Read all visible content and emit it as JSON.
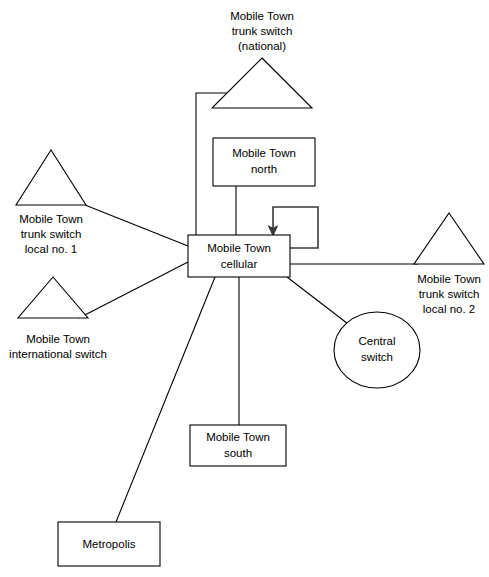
{
  "diagram": {
    "canvas": {
      "width": 489,
      "height": 577
    },
    "colors": {
      "background": "#ffffff",
      "stroke": "#000000",
      "arrow": "#3a3a3a",
      "text": "#000000"
    },
    "nodes": {
      "trunk_national": {
        "shape": "triangle",
        "label_lines": [
          "Mobile Town",
          "trunk switch",
          "(national)"
        ],
        "label_position": "above"
      },
      "mobile_north": {
        "shape": "rectangle",
        "label_lines": [
          "Mobile Town",
          "north"
        ],
        "label_position": "inside"
      },
      "mobile_cellular": {
        "shape": "rectangle",
        "label_lines": [
          "Mobile Town",
          "cellular"
        ],
        "label_position": "inside"
      },
      "trunk_local_1": {
        "shape": "triangle",
        "label_lines": [
          "Mobile Town",
          "trunk switch",
          "local no. 1"
        ],
        "label_position": "below"
      },
      "international": {
        "shape": "triangle",
        "label_lines": [
          "Mobile Town",
          "international switch"
        ],
        "label_position": "below"
      },
      "trunk_local_2": {
        "shape": "triangle",
        "label_lines": [
          "Mobile Town",
          "trunk switch",
          "local no. 2"
        ],
        "label_position": "below"
      },
      "central_switch": {
        "shape": "ellipse",
        "label_lines": [
          "Central",
          "switch"
        ],
        "label_position": "inside"
      },
      "mobile_south": {
        "shape": "rectangle",
        "label_lines": [
          "Mobile Town",
          "south"
        ],
        "label_position": "inside"
      },
      "metropolis": {
        "shape": "rectangle",
        "label_lines": [
          "Metropolis"
        ],
        "label_position": "inside"
      }
    },
    "links": [
      {
        "id": "cellular-trunk-national",
        "from": "mobile_cellular",
        "to": "trunk_national",
        "style": "orthogonal"
      },
      {
        "id": "cellular-mobile-north",
        "from": "mobile_cellular",
        "to": "mobile_north",
        "style": "straight"
      },
      {
        "id": "cellular-trunk-local-1",
        "from": "mobile_cellular",
        "to": "trunk_local_1",
        "style": "straight"
      },
      {
        "id": "cellular-international",
        "from": "mobile_cellular",
        "to": "international",
        "style": "straight"
      },
      {
        "id": "cellular-trunk-local-2",
        "from": "mobile_cellular",
        "to": "trunk_local_2",
        "style": "straight"
      },
      {
        "id": "cellular-central-switch",
        "from": "mobile_cellular",
        "to": "central_switch",
        "style": "straight"
      },
      {
        "id": "cellular-mobile-south",
        "from": "mobile_cellular",
        "to": "mobile_south",
        "style": "straight"
      },
      {
        "id": "cellular-metropolis",
        "from": "mobile_cellular",
        "to": "metropolis",
        "style": "straight"
      },
      {
        "id": "cellular-self-loop",
        "from": "mobile_cellular",
        "to": "mobile_cellular",
        "style": "loopback-arrow"
      }
    ]
  }
}
